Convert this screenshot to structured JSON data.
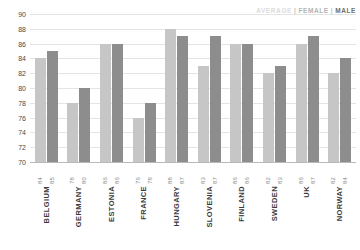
{
  "legend": {
    "average_label": "AVERAGE",
    "female_label": "FEMALE",
    "male_label": "MALE",
    "separator": "|",
    "average_color": "#dcdcdc",
    "female_color": "#c6c6c6",
    "male_color": "#8d8d8d"
  },
  "chart_data": {
    "type": "bar",
    "title": "",
    "subtitle": "",
    "xlabel": "",
    "ylabel": "",
    "ylim": [
      70,
      90
    ],
    "yticks": [
      70,
      72,
      74,
      76,
      78,
      80,
      82,
      84,
      86,
      88,
      90
    ],
    "grid": true,
    "legend_position": "top-right",
    "categories": [
      "BELGIUM",
      "GERMANY",
      "ESTONIA",
      "FRANCE",
      "HUNGARY",
      "SLOVENIA",
      "FINLAND",
      "SWEDEN",
      "UK",
      "NORWAY"
    ],
    "series": [
      {
        "name": "FEMALE",
        "color": "#c6c6c6",
        "values": [
          84,
          78,
          86,
          76,
          88,
          83,
          86,
          82,
          86,
          82
        ]
      },
      {
        "name": "MALE",
        "color": "#8d8d8d",
        "values": [
          85,
          80,
          86,
          78,
          87,
          87,
          86,
          83,
          87,
          84
        ]
      }
    ],
    "value_labels": [
      [
        "84",
        "85"
      ],
      [
        "78",
        "80"
      ],
      [
        "86",
        "86"
      ],
      [
        "76",
        "78"
      ],
      [
        "88",
        "87"
      ],
      [
        "83",
        "87"
      ],
      [
        "86",
        "86"
      ],
      [
        "82",
        "83"
      ],
      [
        "86",
        "87"
      ],
      [
        "82",
        "84"
      ]
    ]
  }
}
